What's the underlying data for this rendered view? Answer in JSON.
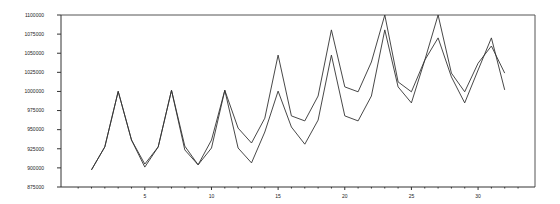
{
  "chart_data": {
    "type": "line",
    "title": "",
    "xlabel": "",
    "ylabel": "",
    "x": [
      1,
      2,
      3,
      4,
      5,
      6,
      7,
      8,
      9,
      10,
      11,
      12,
      13,
      14,
      15,
      16,
      17,
      18,
      19,
      20,
      21,
      22,
      23,
      24,
      25,
      26,
      27,
      28,
      29,
      30,
      31,
      32
    ],
    "series": [
      {
        "name": "series-1",
        "color": "#333333",
        "values": [
          897500,
          927500,
          1000000,
          936500,
          905000,
          927500,
          1001500,
          928500,
          904000,
          936500,
          1001500,
          952000,
          932500,
          965000,
          1047500,
          968000,
          961500,
          994000,
          1080500,
          1006000,
          999500,
          1038500,
          1100000,
          1012500,
          999500,
          1041000,
          1100000,
          1024000,
          999500,
          1037000,
          1059500,
          1024000
        ]
      },
      {
        "name": "series-2",
        "color": "#333333",
        "values": [
          897500,
          927500,
          1000000,
          936500,
          901000,
          927500,
          1001500,
          923500,
          904000,
          926000,
          1001500,
          926000,
          906500,
          947000,
          1000500,
          953500,
          931000,
          962500,
          1047500,
          968000,
          961500,
          994000,
          1080500,
          1006000,
          985000,
          1041000,
          1070000,
          1019000,
          985000,
          1028000,
          1070000,
          1002000
        ]
      }
    ],
    "ylim": [
      875000,
      1100000
    ],
    "yticks": [
      875000,
      900000,
      925000,
      950000,
      975000,
      1000000,
      1025000,
      1050000,
      1075000,
      1100000
    ],
    "ytick_labels": [
      "875000",
      "900000",
      "925000",
      "950000",
      "975000",
      "1000000",
      "1025000",
      "1050000",
      "1075000",
      "1100000"
    ],
    "xlim": [
      -1.3,
      34.3
    ],
    "xticks": [
      5,
      10,
      15,
      20,
      25,
      30
    ],
    "xtick_labels": [
      "5",
      "10",
      "15",
      "20",
      "25",
      "30"
    ],
    "grid": false,
    "legend": null
  }
}
